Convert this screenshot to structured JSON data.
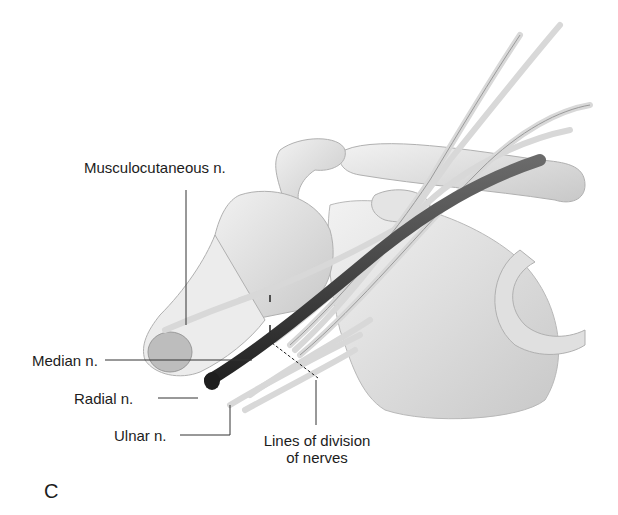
{
  "figure": {
    "panel_letter": "C",
    "labels": {
      "musculocutaneous": "Musculocutaneous n.",
      "median": "Median n.",
      "radial": "Radial n.",
      "ulnar": "Ulnar n.",
      "division_line1": "Lines of division",
      "division_line2": "of nerves"
    },
    "colors": {
      "bone": "#e6e6e6",
      "bone_shade": "#c4c4c4",
      "nerve": "#dedede",
      "vessel": "#3a3a3a",
      "leader": "#333333"
    }
  }
}
